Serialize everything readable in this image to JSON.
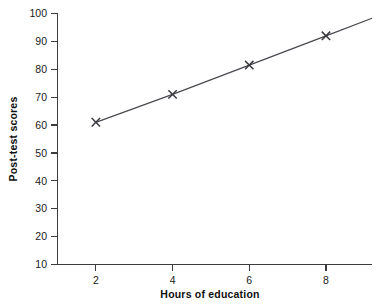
{
  "chart_data": {
    "type": "line",
    "title": "",
    "xlabel": "Hours of education",
    "ylabel": "Post-test scores",
    "x": [
      2,
      4,
      6,
      8
    ],
    "values": [
      61,
      71,
      81.5,
      92
    ],
    "series": [
      {
        "name": "Post-test scores",
        "values": [
          61,
          71,
          81.5,
          92
        ]
      }
    ],
    "xlim": [
      1,
      9.2
    ],
    "ylim": [
      10,
      100
    ],
    "xticks": [
      2,
      4,
      6,
      8
    ],
    "yticks": [
      10,
      20,
      30,
      40,
      50,
      60,
      70,
      80,
      90,
      100
    ],
    "xtick_labels": [
      "2",
      "4",
      "6",
      "8"
    ],
    "ytick_labels": [
      "10",
      "20",
      "30",
      "40",
      "50",
      "60",
      "70",
      "80",
      "90",
      "100"
    ],
    "grid": false,
    "legend": false,
    "legend_position": "none",
    "marker": "x",
    "line_extends_beyond_last_point": true,
    "colors": {
      "line": "#4a4a50",
      "marker": "#3a3a40",
      "axis": "#3b3b40",
      "text": "#1a1a1a",
      "background": "#ffffff"
    }
  },
  "axes": {
    "y_title": "Post-test scores",
    "x_title": "Hours of education"
  }
}
